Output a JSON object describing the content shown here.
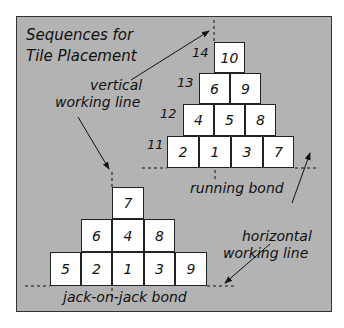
{
  "title_line1": "Sequences for",
  "title_line2": "Tile Placement",
  "labels": {
    "vertical1": "vertical",
    "vertical2": "working line",
    "horizontal1": "horizontal",
    "horizontal2": "working line",
    "running": "running bond",
    "jack": "jack-on-jack bond"
  },
  "running_bond": {
    "row_labels": [
      "14",
      "13",
      "12",
      "11"
    ],
    "rows": [
      [
        "10"
      ],
      [
        "6",
        "9"
      ],
      [
        "4",
        "5",
        "8"
      ],
      [
        "2",
        "1",
        "3",
        "7"
      ]
    ]
  },
  "jack_bond": {
    "rows": [
      [
        "7"
      ],
      [
        "6",
        "4",
        "8"
      ],
      [
        "5",
        "2",
        "1",
        "3",
        "9"
      ]
    ]
  }
}
